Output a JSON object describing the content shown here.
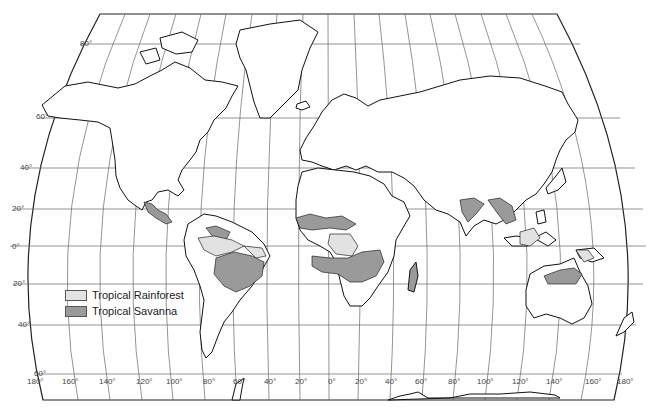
{
  "map": {
    "type": "world-outline-map",
    "projection": "pseudo-cylindrical (Robinson-like)",
    "colors": {
      "background": "#ffffff",
      "outline": "#111111",
      "graticule": "#555555",
      "rainforest": "#e2e2e2",
      "savanna": "#9a9a9a"
    },
    "latitude_labels": [
      "80°",
      "60°",
      "40°",
      "20°",
      "0°",
      "20°",
      "40°",
      "60°"
    ],
    "longitude_labels": [
      "180°",
      "160°",
      "140°",
      "120°",
      "100°",
      "80°",
      "60°",
      "40°",
      "20°",
      "0°",
      "20°",
      "40°",
      "60°",
      "80°",
      "100°",
      "120°",
      "140°",
      "160°",
      "180°"
    ]
  },
  "legend": {
    "items": [
      {
        "label": "Tropical Rainforest",
        "color": "#e2e2e2"
      },
      {
        "label": "Tropical Savanna",
        "color": "#9a9a9a"
      }
    ]
  }
}
